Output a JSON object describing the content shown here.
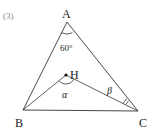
{
  "problem_number": "(3)",
  "vertices": {
    "A": {
      "label": "A",
      "x": 67,
      "y": 22
    },
    "B": {
      "label": "B",
      "x": 23,
      "y": 110
    },
    "C": {
      "label": "C",
      "x": 138,
      "y": 111
    },
    "H": {
      "label": "H",
      "x": 66,
      "y": 75
    }
  },
  "angles": {
    "A": "60°",
    "H": "α",
    "C": "β"
  },
  "colors": {
    "line": "#333333",
    "text": "#222222",
    "number": "#888888"
  }
}
